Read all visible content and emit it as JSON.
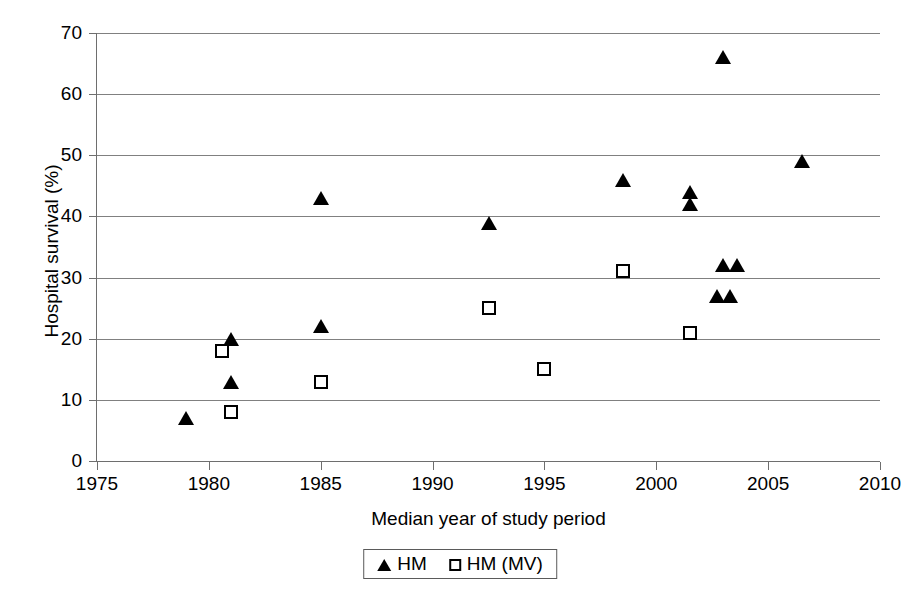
{
  "chart_data": {
    "type": "scatter",
    "title": "",
    "xlabel": "Median year of study period",
    "ylabel": "Hospital survival (%)",
    "xlim": [
      1975,
      2010
    ],
    "ylim": [
      0,
      70
    ],
    "xticks": [
      1975,
      1980,
      1985,
      1990,
      1995,
      2000,
      2005,
      2010
    ],
    "yticks": [
      0,
      10,
      20,
      30,
      40,
      50,
      60,
      70
    ],
    "grid": "horizontal",
    "legend_position": "bottom-center",
    "series": [
      {
        "name": "HM",
        "marker": "filled-triangle",
        "color": "#000000",
        "points": [
          {
            "x": 1979.0,
            "y": 7
          },
          {
            "x": 1981.0,
            "y": 20
          },
          {
            "x": 1981.0,
            "y": 13
          },
          {
            "x": 1985.0,
            "y": 43
          },
          {
            "x": 1985.0,
            "y": 22
          },
          {
            "x": 1992.5,
            "y": 39
          },
          {
            "x": 1998.5,
            "y": 46
          },
          {
            "x": 2001.5,
            "y": 44
          },
          {
            "x": 2001.5,
            "y": 42
          },
          {
            "x": 2003.0,
            "y": 66
          },
          {
            "x": 2002.7,
            "y": 27
          },
          {
            "x": 2003.3,
            "y": 27
          },
          {
            "x": 2003.0,
            "y": 32
          },
          {
            "x": 2003.6,
            "y": 32
          },
          {
            "x": 2006.5,
            "y": 49
          }
        ]
      },
      {
        "name": "HM (MV)",
        "marker": "open-square",
        "color": "#000000",
        "points": [
          {
            "x": 1980.6,
            "y": 18
          },
          {
            "x": 1981.0,
            "y": 8
          },
          {
            "x": 1985.0,
            "y": 13
          },
          {
            "x": 1992.5,
            "y": 25
          },
          {
            "x": 1995.0,
            "y": 15
          },
          {
            "x": 1998.5,
            "y": 31
          },
          {
            "x": 2001.5,
            "y": 21
          }
        ]
      }
    ]
  },
  "axes": {
    "y_title": "Hospital survival (%)",
    "x_title": "Median year of study period",
    "y_tick_labels": [
      "70",
      "60",
      "50",
      "40",
      "30",
      "20",
      "10",
      "0"
    ],
    "x_tick_labels": [
      "1975",
      "1980",
      "1985",
      "1990",
      "1995",
      "2000",
      "2005",
      "2010"
    ]
  },
  "legend": {
    "entries": [
      {
        "label": "HM",
        "marker": "filled-triangle"
      },
      {
        "label": "HM (MV)",
        "marker": "open-square"
      }
    ]
  }
}
